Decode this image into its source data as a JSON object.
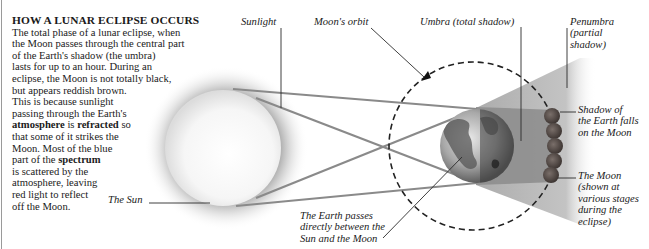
{
  "intro": {
    "title": "HOW A LUNAR ECLIPSE OCCURS",
    "lines": [
      "The total phase of a lunar eclipse, when",
      "the Moon passes through the central part",
      "of the Earth's shadow (the umbra)",
      "lasts for up to an hour. During an",
      "eclipse, the Moon is not totally black,",
      "but appears reddish brown.",
      "This is because sunlight",
      "passing through the Earth's"
    ],
    "line9": {
      "bold1": "atmosphere",
      "t1": " is ",
      "bold2": "refracted",
      "t2": " so"
    },
    "line10": "that some of it strikes the",
    "line11": "Moon. Most of the blue",
    "line12": {
      "t1": "part of the ",
      "bold1": "spectrum"
    },
    "line13": "is scattered by the",
    "line14": "atmosphere, leaving",
    "line15": "red light to reflect",
    "line16": "off the Moon."
  },
  "labels": {
    "sunlight": "Sunlight",
    "moons_orbit": "Moon's orbit",
    "umbra": "Umbra (total shadow)",
    "penumbra": [
      "Penumbra",
      "(partial",
      "shadow)"
    ],
    "shadow_falls": [
      "Shadow of",
      "the Earth falls",
      "on the Moon"
    ],
    "the_moon": [
      "The Moon",
      "(shown at",
      "various stages",
      "during the",
      "eclipse)"
    ],
    "the_sun": "The Sun",
    "earth_passes": [
      "The Earth passes",
      "directly between the",
      "Sun and the Moon"
    ]
  },
  "colors": {
    "ray": "#8c8c8c",
    "umbra": "#8f8f8f",
    "penumbra": "#b5b5b5",
    "leader": "#2a2a2a",
    "moon": "#5a4f4a"
  }
}
